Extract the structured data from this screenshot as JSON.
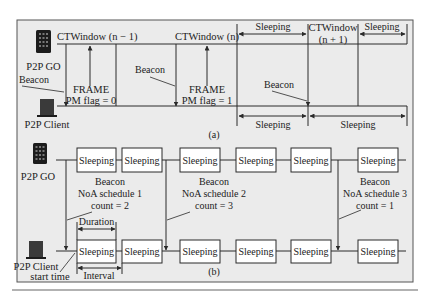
{
  "colors": {
    "panel_bg": "#ebebeb",
    "line": "#2a2a2a",
    "box_bg": "#ffffff",
    "device": "#1c1c1c"
  },
  "panel_a": {
    "caption": "(a)",
    "go_label": "P2P GO",
    "client_label": "P2P Client",
    "beacon_left": "Beacon",
    "ctw_n_minus_1": "CTWindow (n − 1)",
    "ctw_n": "CTWindow (n)",
    "ctw_n_plus_1_line1": "CTWindow",
    "ctw_n_plus_1_line2": "(n + 1)",
    "frame1_line1": "FRAME",
    "frame1_line2": "PM flag = 0",
    "frame2_line1": "FRAME",
    "frame2_line2": "PM flag = 1",
    "beacon_mid": "Beacon",
    "beacon_right": "Beacon",
    "go_sleep_1": "Sleeping",
    "go_sleep_2": "Sleeping",
    "client_sleep_1": "Sleeping",
    "client_sleep_2": "Sleeping"
  },
  "panel_b": {
    "caption": "(b)",
    "go_label": "P2P GO",
    "client_label_line1": "P2P Client",
    "client_label_line2": "start time",
    "duration_label": "Duration",
    "interval_label": "Interval",
    "go_boxes": [
      "Sleeping",
      "Sleeping",
      "Sleeping",
      "Sleeping",
      "Sleeping",
      "Sleeping"
    ],
    "client_boxes": [
      "Sleeping",
      "Sleeping",
      "Sleeping",
      "Sleeping",
      "Sleeping",
      "Sleeping"
    ],
    "beacons": [
      {
        "line1": "Beacon",
        "line2": "NoA schedule 1",
        "line3": "count = 2"
      },
      {
        "line1": "Beacon",
        "line2": "NoA schedule 2",
        "line3": "count = 3"
      },
      {
        "line1": "Beacon",
        "line2": "NoA schedule 3",
        "line3": "count = 1"
      }
    ]
  }
}
